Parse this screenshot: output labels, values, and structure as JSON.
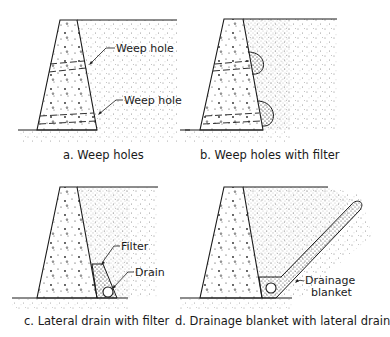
{
  "diagram": {
    "panels": [
      {
        "id": "a",
        "caption": "a.  Weep holes",
        "callouts": [
          "Weep hole",
          "Weep hole"
        ]
      },
      {
        "id": "b",
        "caption": "b.  Weep holes with filter",
        "callouts": []
      },
      {
        "id": "c",
        "caption": "c. Lateral drain with filter",
        "callouts": [
          "Filter",
          "Drain"
        ]
      },
      {
        "id": "d",
        "caption": "d.  Drainage blanket with lateral drain",
        "callouts": [
          "Drainage",
          "blanket"
        ]
      }
    ],
    "colors": {
      "line": "#1a1a1a",
      "background": "#ffffff",
      "stipple": "#555555"
    }
  }
}
